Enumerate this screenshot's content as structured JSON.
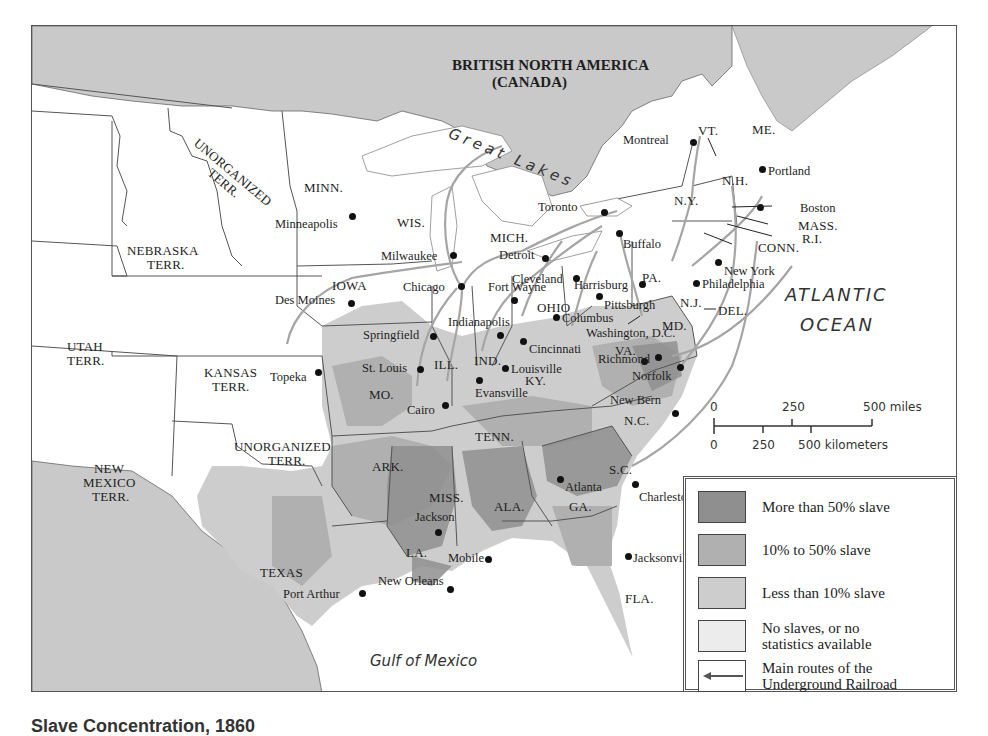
{
  "title": {
    "country": "BRITISH NORTH AMERICA",
    "country_sub": "(CANADA)"
  },
  "water_labels": {
    "great_lakes": "Great Lakes",
    "atlantic_1": "ATLANTIC",
    "atlantic_2": "OCEAN",
    "gulf": "Gulf of Mexico"
  },
  "regions": [
    {
      "id": "unorg-n",
      "label": "UNORGANIZED\nTERR.",
      "x": 168,
      "y": 110,
      "rotate": 40
    },
    {
      "id": "minn",
      "label": "MINN.",
      "x": 272,
      "y": 155
    },
    {
      "id": "wis",
      "label": "WIS.",
      "x": 365,
      "y": 190
    },
    {
      "id": "nebraska",
      "label": "NEBRASKA",
      "x": 95,
      "y": 218
    },
    {
      "id": "nebraska2",
      "label": "TERR.",
      "x": 115,
      "y": 232
    },
    {
      "id": "mich",
      "label": "MICH.",
      "x": 458,
      "y": 205
    },
    {
      "id": "iowa",
      "label": "IOWA",
      "x": 300,
      "y": 253
    },
    {
      "id": "ohio",
      "label": "OHIO",
      "x": 505,
      "y": 275
    },
    {
      "id": "pa",
      "label": "PA.",
      "x": 610,
      "y": 245
    },
    {
      "id": "ny",
      "label": "N.Y.",
      "x": 642,
      "y": 168
    },
    {
      "id": "vt",
      "label": "VT.",
      "x": 666,
      "y": 98
    },
    {
      "id": "me",
      "label": "ME.",
      "x": 720,
      "y": 97
    },
    {
      "id": "nh",
      "label": "N.H.",
      "x": 690,
      "y": 148
    },
    {
      "id": "nj",
      "label": "N.J.",
      "x": 648,
      "y": 270
    },
    {
      "id": "md",
      "label": "MD.",
      "x": 630,
      "y": 293
    },
    {
      "id": "utah",
      "label": "UTAH",
      "x": 35,
      "y": 314
    },
    {
      "id": "utah2",
      "label": "TERR.",
      "x": 35,
      "y": 328
    },
    {
      "id": "kansas",
      "label": "KANSAS",
      "x": 172,
      "y": 340
    },
    {
      "id": "kansas2",
      "label": "TERR.",
      "x": 180,
      "y": 354
    },
    {
      "id": "ill",
      "label": "ILL.",
      "x": 402,
      "y": 332
    },
    {
      "id": "ind",
      "label": "IND.",
      "x": 442,
      "y": 328
    },
    {
      "id": "va",
      "label": "VA.",
      "x": 583,
      "y": 318
    },
    {
      "id": "mo",
      "label": "MO.",
      "x": 337,
      "y": 362
    },
    {
      "id": "ky",
      "label": "KY.",
      "x": 493,
      "y": 348
    },
    {
      "id": "tenn",
      "label": "TENN.",
      "x": 443,
      "y": 404
    },
    {
      "id": "nc",
      "label": "N.C.",
      "x": 592,
      "y": 388
    },
    {
      "id": "unorg-s",
      "label": "UNORGANIZED",
      "x": 202,
      "y": 414
    },
    {
      "id": "unorg-s2",
      "label": "TERR.",
      "x": 236,
      "y": 428
    },
    {
      "id": "ark",
      "label": "ARK.",
      "x": 340,
      "y": 434
    },
    {
      "id": "sc",
      "label": "S.C.",
      "x": 577,
      "y": 437
    },
    {
      "id": "new-mexico",
      "label": "NEW",
      "x": 62,
      "y": 436
    },
    {
      "id": "new-mexico2",
      "label": "MEXICO",
      "x": 51,
      "y": 450
    },
    {
      "id": "new-mexico3",
      "label": "TERR.",
      "x": 60,
      "y": 464
    },
    {
      "id": "miss",
      "label": "MISS.",
      "x": 397,
      "y": 465
    },
    {
      "id": "ala",
      "label": "ALA.",
      "x": 462,
      "y": 474
    },
    {
      "id": "ga",
      "label": "GA.",
      "x": 537,
      "y": 474
    },
    {
      "id": "la",
      "label": "LA.",
      "x": 374,
      "y": 520
    },
    {
      "id": "texas",
      "label": "TEXAS",
      "x": 228,
      "y": 540
    },
    {
      "id": "fla",
      "label": "FLA.",
      "x": 593,
      "y": 566
    },
    {
      "id": "mass",
      "label": "MASS.",
      "x": 766,
      "y": 193
    },
    {
      "id": "ri",
      "label": "R.I.",
      "x": 770,
      "y": 206
    },
    {
      "id": "conn",
      "label": "CONN.",
      "x": 726,
      "y": 215
    },
    {
      "id": "del",
      "label": "DEL.",
      "x": 686,
      "y": 278
    }
  ],
  "cities": [
    {
      "name": "Montreal",
      "dx": -70,
      "dy": -9,
      "x": 661,
      "y": 116
    },
    {
      "name": "Portland",
      "dx": 6,
      "dy": -5,
      "x": 730,
      "y": 143
    },
    {
      "name": "Minneapolis",
      "dx": -77,
      "dy": 1,
      "x": 320,
      "y": 190
    },
    {
      "name": "Toronto",
      "dx": -66,
      "dy": -12,
      "x": 572,
      "y": 186
    },
    {
      "name": "Boston",
      "dx": 40,
      "dy": -6,
      "x": 728,
      "y": 181
    },
    {
      "name": "Buffalo",
      "dx": 4,
      "dy": 4,
      "x": 587,
      "y": 207
    },
    {
      "name": "Milwaukee",
      "dx": -72,
      "dy": -6,
      "x": 421,
      "y": 229
    },
    {
      "name": "Detroit",
      "dx": -46,
      "dy": -10,
      "x": 513,
      "y": 232
    },
    {
      "name": "New York",
      "dx": 6,
      "dy": 2,
      "x": 686,
      "y": 236
    },
    {
      "name": "Cleveland",
      "dx": -64,
      "dy": -6,
      "x": 544,
      "y": 252
    },
    {
      "name": "Harrisburg",
      "dx": -68,
      "dy": -6,
      "x": 610,
      "y": 258
    },
    {
      "name": "Philadelphia",
      "dx": 6,
      "dy": -6,
      "x": 664,
      "y": 257
    },
    {
      "name": "Chicago",
      "dx": -58,
      "dy": -6,
      "x": 429,
      "y": 260
    },
    {
      "name": "Des Moines",
      "dx": -76,
      "dy": -10,
      "x": 319,
      "y": 277
    },
    {
      "name": "Pittsburgh",
      "dx": 5,
      "dy": 2,
      "x": 567,
      "y": 270
    },
    {
      "name": "Columbus",
      "dx": 6,
      "dy": -6,
      "x": 524,
      "y": 291
    },
    {
      "name": "Springfield",
      "dx": -70,
      "dy": -8,
      "x": 401,
      "y": 310
    },
    {
      "name": "Indianapolis",
      "dx": -52,
      "dy": -20,
      "x": 468,
      "y": 309
    },
    {
      "name": "Cincinnati",
      "dx": 6,
      "dy": 1,
      "x": 491,
      "y": 315
    },
    {
      "name": "Fort Wayne",
      "dx": -26,
      "dy": -20,
      "x": 482,
      "y": 274
    },
    {
      "name": "Washington, D.C.",
      "dx": -58,
      "dy": -35,
      "x": 612,
      "y": 335
    },
    {
      "name": "Richmond",
      "dx": -60,
      "dy": -5,
      "x": 626,
      "y": 331
    },
    {
      "name": "Norfolk",
      "dx": -48,
      "dy": 2,
      "x": 648,
      "y": 341
    },
    {
      "name": "Topeka",
      "dx": -48,
      "dy": -2,
      "x": 286,
      "y": 346
    },
    {
      "name": "St. Louis",
      "dx": -58,
      "dy": -8,
      "x": 388,
      "y": 343
    },
    {
      "name": "Louisville",
      "dx": 6,
      "dy": -6,
      "x": 473,
      "y": 342
    },
    {
      "name": "Evansville",
      "dx": -4,
      "dy": 6,
      "x": 447,
      "y": 354
    },
    {
      "name": "Cairo",
      "dx": -38,
      "dy": -2,
      "x": 413,
      "y": 379
    },
    {
      "name": "New Bern",
      "dx": -65,
      "dy": -20,
      "x": 643,
      "y": 387
    },
    {
      "name": "Atlanta",
      "dx": 5,
      "dy": 1,
      "x": 528,
      "y": 453
    },
    {
      "name": "Charleston",
      "dx": 4,
      "dy": 6,
      "x": 603,
      "y": 458
    },
    {
      "name": "Jackson",
      "dx": -23,
      "dy": -22,
      "x": 406,
      "y": 506
    },
    {
      "name": "Mobile",
      "dx": -40,
      "dy": -8,
      "x": 456,
      "y": 533
    },
    {
      "name": "Jacksonville",
      "dx": 5,
      "dy": -5,
      "x": 596,
      "y": 530
    },
    {
      "name": "New Orleans",
      "dx": -72,
      "dy": -15,
      "x": 418,
      "y": 563
    },
    {
      "name": "Port Arthur",
      "dx": -79,
      "dy": -6,
      "x": 330,
      "y": 567
    }
  ],
  "scale_bar": {
    "miles_0": "0",
    "miles_250": "250",
    "miles_500": "500 miles",
    "km_0": "0",
    "km_250": "250",
    "km_500": "500 kilometers"
  },
  "legend": {
    "items": [
      {
        "label": "More than 50% slave",
        "color": "#8f8f8f"
      },
      {
        "label": "10% to 50% slave",
        "color": "#b0b0b0"
      },
      {
        "label": "Less than 10% slave",
        "color": "#cdcdcd"
      },
      {
        "label": "No slaves, or no statistics available",
        "line1": "No slaves, or no",
        "line2": "statistics available",
        "color": "#ececec"
      },
      {
        "label": "Main routes of the Underground Railroad",
        "line1": "Main routes of the",
        "line2": "Underground Railroad",
        "color": "#ffffff"
      }
    ]
  },
  "caption": "Slave Concentration, 1860",
  "colors": {
    "foreign_land": "#c9c9c9",
    "free_state": "#ffffff",
    "low_slave": "#cdcdcd",
    "mid_slave": "#b0b0b0",
    "high_slave": "#8f8f8f",
    "border": "#555555",
    "route": "#a0a0a0",
    "water": "#ffffff"
  }
}
